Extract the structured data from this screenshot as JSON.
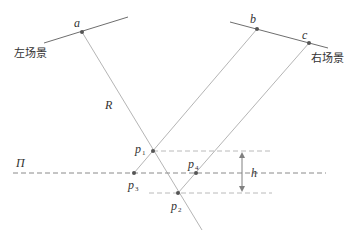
{
  "diagram": {
    "type": "stereo-projection-geometry",
    "colors": {
      "scene_line": "#6e6e6e",
      "ray": "#b5b5b5",
      "dashed": "#9a9a9a",
      "point": "#555555",
      "text": "#333333",
      "arrow": "#808080"
    },
    "labels": {
      "left_scene": "左场景",
      "right_scene": "右场景",
      "a": "a",
      "b": "b",
      "c": "c",
      "R": "R",
      "Pi": "Π",
      "h": "h",
      "p": "p",
      "p1_sub": "1",
      "p2_sub": "2",
      "p3_sub": "3",
      "p4_sub": "4"
    },
    "points": {
      "a": [
        82,
        32
      ],
      "b": [
        257,
        29
      ],
      "c": [
        309,
        43
      ],
      "p1": [
        153,
        151
      ],
      "p2": [
        178,
        193
      ],
      "p3": [
        134,
        173
      ],
      "p4": [
        196,
        173
      ]
    }
  }
}
